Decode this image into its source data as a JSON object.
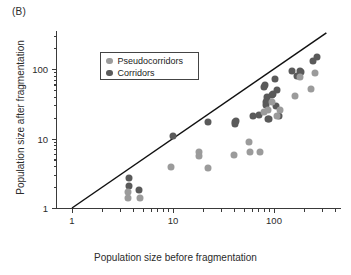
{
  "panel": {
    "label": "(B)"
  },
  "legend": {
    "position": "inside-top-left",
    "entries": [
      {
        "label": "Pseudocorridors",
        "color": "#9b9b9b",
        "marker": "circle"
      },
      {
        "label": "Corridors",
        "color": "#5a5a5a",
        "marker": "circle"
      }
    ]
  },
  "axes": {
    "x": {
      "title": "Population size before fragmentation",
      "scale": "log",
      "ticks": [
        1,
        10,
        100
      ],
      "tick_labels": [
        "1",
        "10",
        "100"
      ],
      "range": [
        0.8,
        400
      ]
    },
    "y": {
      "title": "Population size after fragmentation",
      "scale": "log",
      "ticks": [
        1,
        10,
        100
      ],
      "tick_labels": [
        "1",
        "10",
        "100"
      ],
      "range": [
        0.9,
        300
      ]
    }
  },
  "annotations": [
    {
      "name": "one-to-one-line",
      "type": "line",
      "from": [
        1,
        1
      ],
      "to": [
        330,
        330
      ],
      "color": "#111111"
    }
  ],
  "chart_data": {
    "type": "scatter",
    "title": "",
    "xlabel": "Population size before fragmentation",
    "ylabel": "Population size after fragmentation",
    "xscale": "log",
    "yscale": "log",
    "xlim": [
      0.8,
      400
    ],
    "ylim": [
      0.9,
      300
    ],
    "grid": false,
    "legend_position": "inside-top-left",
    "reference_line": {
      "label": "1:1 line",
      "slope": 1,
      "intercept": 0
    },
    "series": [
      {
        "name": "Corridors",
        "color": "#5a5a5a",
        "points": [
          [
            3.7,
            2.7
          ],
          [
            3.7,
            2.1
          ],
          [
            4.6,
            1.8
          ],
          [
            10,
            11
          ],
          [
            22,
            17
          ],
          [
            41,
            16
          ],
          [
            41,
            17.5
          ],
          [
            42,
            18
          ],
          [
            62,
            21
          ],
          [
            71,
            22
          ],
          [
            80,
            56
          ],
          [
            82,
            58
          ],
          [
            84,
            30
          ],
          [
            84,
            33
          ],
          [
            85,
            36
          ],
          [
            86,
            39
          ],
          [
            88,
            19
          ],
          [
            90,
            19
          ],
          [
            95,
            42
          ],
          [
            98,
            44
          ],
          [
            102,
            72
          ],
          [
            104,
            29
          ],
          [
            108,
            50
          ],
          [
            112,
            21
          ],
          [
            150,
            93
          ],
          [
            170,
            80
          ],
          [
            180,
            95
          ],
          [
            185,
            90
          ],
          [
            245,
            130
          ],
          [
            265,
            150
          ]
        ]
      },
      {
        "name": "Pseudocorridors",
        "color": "#9b9b9b",
        "points": [
          [
            3.6,
            1.7
          ],
          [
            3.6,
            1.4
          ],
          [
            4.7,
            1.4
          ],
          [
            9.5,
            3.9
          ],
          [
            18,
            6.3
          ],
          [
            18,
            5.6
          ],
          [
            22,
            3.8
          ],
          [
            40,
            5.7
          ],
          [
            57,
            9.0
          ],
          [
            58,
            6.4
          ],
          [
            72,
            6.4
          ],
          [
            80,
            24
          ],
          [
            88,
            26
          ],
          [
            95,
            33
          ],
          [
            108,
            21
          ],
          [
            115,
            26
          ],
          [
            160,
            41
          ],
          [
            180,
            76
          ],
          [
            230,
            51
          ],
          [
            255,
            88
          ]
        ]
      }
    ]
  }
}
